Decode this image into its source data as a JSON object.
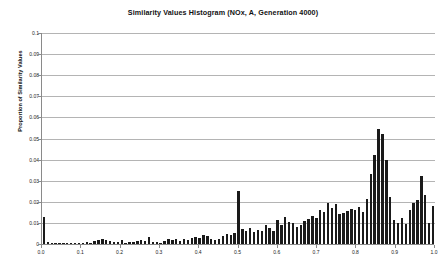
{
  "chart_data": {
    "type": "bar",
    "title": "Similarity Values Histogram (NOx, A, Generation 4000)",
    "subtitle": "",
    "xlabel": "",
    "ylabel": "Proportion of Similarity Values",
    "xlim": [
      0.0,
      1.0
    ],
    "ylim": [
      0,
      0.1
    ],
    "grid": true,
    "legend": null,
    "x_tick_labels": [
      "0.0",
      "0.1",
      "0.2",
      "0.3",
      "0.4",
      "0.5",
      "0.6",
      "0.7",
      "0.8",
      "0.9",
      "1.0"
    ],
    "x_tick_values": [
      0.0,
      0.1,
      0.2,
      0.3,
      0.4,
      0.5,
      0.6,
      0.7,
      0.8,
      0.9,
      1.0
    ],
    "y_tick_labels": [
      "0",
      "0.01",
      "0.02",
      "0.03",
      "0.04",
      "0.05",
      "0.06",
      "0.07",
      "0.08",
      "0.09",
      "0.1"
    ],
    "y_tick_values": [
      0,
      0.01,
      0.02,
      0.03,
      0.04,
      0.05,
      0.06,
      0.07,
      0.08,
      0.09,
      0.1
    ],
    "bar_color": "#1a1a1a",
    "bin_width": 0.01,
    "categories": [
      0.0,
      0.01,
      0.02,
      0.03,
      0.04,
      0.05,
      0.06,
      0.07,
      0.08,
      0.09,
      0.1,
      0.11,
      0.12,
      0.13,
      0.14,
      0.15,
      0.16,
      0.17,
      0.18,
      0.19,
      0.2,
      0.21,
      0.22,
      0.23,
      0.24,
      0.25,
      0.26,
      0.27,
      0.28,
      0.29,
      0.3,
      0.31,
      0.32,
      0.33,
      0.34,
      0.35,
      0.36,
      0.37,
      0.38,
      0.39,
      0.4,
      0.41,
      0.42,
      0.43,
      0.44,
      0.45,
      0.46,
      0.47,
      0.48,
      0.49,
      0.5,
      0.51,
      0.52,
      0.53,
      0.54,
      0.55,
      0.56,
      0.57,
      0.58,
      0.59,
      0.6,
      0.61,
      0.62,
      0.63,
      0.64,
      0.65,
      0.66,
      0.67,
      0.68,
      0.69,
      0.7,
      0.71,
      0.72,
      0.73,
      0.74,
      0.75,
      0.76,
      0.77,
      0.78,
      0.79,
      0.8,
      0.81,
      0.82,
      0.83,
      0.84,
      0.85,
      0.86,
      0.87,
      0.88,
      0.89,
      0.9,
      0.91,
      0.92,
      0.93,
      0.94,
      0.95,
      0.96,
      0.97,
      0.98,
      0.99,
      1.0
    ],
    "values": [
      0.0128,
      0.0008,
      0.0004,
      0.0005,
      0.0003,
      0.0004,
      0.0006,
      0.0004,
      0.0005,
      0.0006,
      0.0007,
      0.0009,
      0.0004,
      0.0012,
      0.0018,
      0.0022,
      0.0019,
      0.0016,
      0.0011,
      0.0008,
      0.002,
      0.0006,
      0.0008,
      0.0009,
      0.0014,
      0.0018,
      0.0012,
      0.0032,
      0.0011,
      0.0008,
      0.0007,
      0.0012,
      0.0025,
      0.0018,
      0.0022,
      0.0016,
      0.0024,
      0.002,
      0.0028,
      0.0035,
      0.003,
      0.0042,
      0.0038,
      0.0026,
      0.0018,
      0.0022,
      0.004,
      0.0048,
      0.0044,
      0.0052,
      0.025,
      0.0072,
      0.006,
      0.0078,
      0.0055,
      0.0068,
      0.006,
      0.009,
      0.0075,
      0.0062,
      0.0115,
      0.0088,
      0.013,
      0.0105,
      0.01,
      0.0082,
      0.0092,
      0.011,
      0.0118,
      0.0135,
      0.0125,
      0.016,
      0.015,
      0.0195,
      0.017,
      0.0192,
      0.014,
      0.0148,
      0.0155,
      0.0165,
      0.016,
      0.0175,
      0.015,
      0.0215,
      0.033,
      0.042,
      0.0545,
      0.052,
      0.04,
      0.0225,
      0.0115,
      0.01,
      0.0125,
      0.0095,
      0.016,
      0.0195,
      0.021,
      0.032,
      0.023,
      0.01,
      0.018
    ]
  }
}
